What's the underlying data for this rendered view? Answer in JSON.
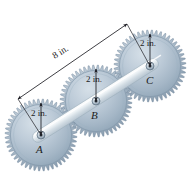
{
  "figure": {
    "background_color": "#ffffff",
    "gear_body_color": "#aebecb",
    "gear_edge_color": "#7e93a6",
    "bar_color": "#e9eef2",
    "annotation_color": "#1c1c22",
    "width": 193,
    "height": 176
  },
  "gears": [
    {
      "id": "A",
      "label": "A",
      "radius_label": "2 in.",
      "center": {
        "x": 41,
        "y": 135
      },
      "radius_px": 36,
      "teeth": 48
    },
    {
      "id": "B",
      "label": "B",
      "radius_label": "2 in.",
      "center": {
        "x": 96,
        "y": 101
      },
      "radius_px": 36,
      "teeth": 48
    },
    {
      "id": "C",
      "label": "C",
      "radius_label": "2 in.",
      "center": {
        "x": 150,
        "y": 66
      },
      "radius_px": 36,
      "teeth": 48
    }
  ],
  "dimensions": [
    {
      "name": "span-a-to-c",
      "label": "8 in.",
      "from": {
        "x": 18,
        "y": 99
      },
      "to": {
        "x": 127,
        "y": 24
      },
      "arrows": "both"
    },
    {
      "name": "radius-a",
      "label": "2 in.",
      "from": {
        "x": 41,
        "y": 103
      },
      "to": {
        "x": 41,
        "y": 135
      },
      "arrows": "both"
    },
    {
      "name": "radius-b",
      "label": "2 in.",
      "from": {
        "x": 96,
        "y": 69
      },
      "to": {
        "x": 96,
        "y": 101
      },
      "arrows": "both"
    },
    {
      "name": "radius-c",
      "label": "2 in.",
      "from": {
        "x": 150,
        "y": 34
      },
      "to": {
        "x": 150,
        "y": 66
      },
      "arrows": "both"
    }
  ],
  "link_bar": {
    "name": "connecting-bar",
    "from": {
      "x": 41,
      "y": 135
    },
    "to": {
      "x": 150,
      "y": 66
    },
    "thickness_px": 11
  }
}
